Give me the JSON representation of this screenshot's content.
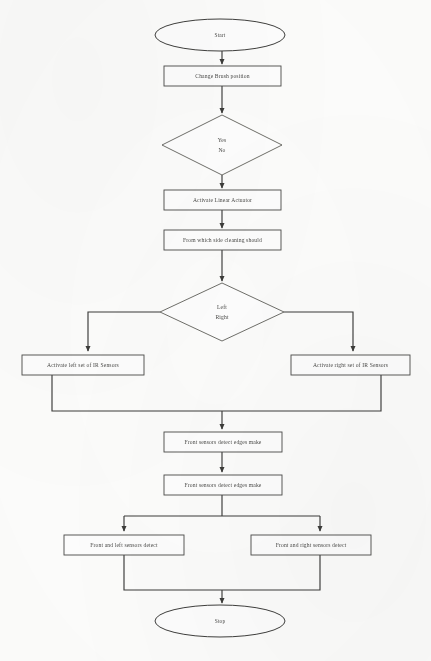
{
  "diagram": {
    "type": "flowchart",
    "orientation": "top-to-bottom",
    "canvas": {
      "width": 431,
      "height": 661
    },
    "style": {
      "background": "#fdfdfc",
      "node_fill": "#fefefe",
      "node_stroke": "#4a4a48",
      "connector_stroke": "#3c3c3a",
      "text_color": "#4b4b49"
    },
    "nodes": [
      {
        "id": "start",
        "shape": "ellipse",
        "label": "Start",
        "cx": 220,
        "cy": 35,
        "rx": 65,
        "ry": 16
      },
      {
        "id": "change-brush",
        "shape": "process",
        "label": "Change Brush position",
        "x": 164,
        "y": 66,
        "w": 117,
        "h": 20
      },
      {
        "id": "decision-yes-no",
        "shape": "decision",
        "label_primary": "Yes",
        "label_secondary": "No",
        "cx": 222,
        "cy": 145,
        "rx": 60,
        "ry": 30
      },
      {
        "id": "activate-linear-actuator",
        "shape": "process",
        "label": "Activate Linear Actuator",
        "x": 164,
        "y": 190,
        "w": 117,
        "h": 20
      },
      {
        "id": "which-side",
        "shape": "process",
        "label": "From which side cleaning should",
        "x": 164,
        "y": 230,
        "w": 117,
        "h": 20
      },
      {
        "id": "decision-left-right",
        "shape": "decision",
        "label_primary": "Left",
        "label_secondary": "Right",
        "cx": 222,
        "cy": 312,
        "rx": 62,
        "ry": 29
      },
      {
        "id": "activate-left-ir",
        "shape": "process",
        "label": "Activate left set of IR Sensors",
        "x": 22,
        "y": 355,
        "w": 122,
        "h": 20
      },
      {
        "id": "activate-right-ir",
        "shape": "process",
        "label": "Activate right set of IR Sensors",
        "x": 291,
        "y": 355,
        "w": 119,
        "h": 20
      },
      {
        "id": "front-sensors-1",
        "shape": "process",
        "label": "Front sensors detect edges   make",
        "x": 164,
        "y": 432,
        "w": 118,
        "h": 20
      },
      {
        "id": "front-sensors-2",
        "shape": "process",
        "label": "Front sensors detect edges   make",
        "x": 164,
        "y": 475,
        "w": 118,
        "h": 20
      },
      {
        "id": "front-left-detect",
        "shape": "process",
        "label": "Front and left sensors detect",
        "x": 64,
        "y": 535,
        "w": 120,
        "h": 20
      },
      {
        "id": "front-right-detect",
        "shape": "process",
        "label": "Front and right sensors detect",
        "x": 251,
        "y": 535,
        "w": 120,
        "h": 20
      },
      {
        "id": "stop",
        "shape": "ellipse",
        "label": "Stop",
        "cx": 220,
        "cy": 621,
        "rx": 65,
        "ry": 16
      }
    ],
    "edges": [
      {
        "id": "e-start-brush",
        "from": "start",
        "to": "change-brush",
        "label": ""
      },
      {
        "id": "e-brush-decision",
        "from": "change-brush",
        "to": "decision-yes-no",
        "label": ""
      },
      {
        "id": "e-decision-actuator",
        "from": "decision-yes-no",
        "to": "activate-linear-actuator",
        "label": ""
      },
      {
        "id": "e-actuator-side",
        "from": "activate-linear-actuator",
        "to": "which-side",
        "label": ""
      },
      {
        "id": "e-side-decision",
        "from": "which-side",
        "to": "decision-left-right",
        "label": ""
      },
      {
        "id": "e-left-branch",
        "from": "decision-left-right",
        "to": "activate-left-ir",
        "label": "Left"
      },
      {
        "id": "e-right-branch",
        "from": "decision-left-right",
        "to": "activate-right-ir",
        "label": "Right"
      },
      {
        "id": "e-left-merge",
        "from": "activate-left-ir",
        "to": "front-sensors-1",
        "label": ""
      },
      {
        "id": "e-right-merge",
        "from": "activate-right-ir",
        "to": "front-sensors-1",
        "label": ""
      },
      {
        "id": "e-front1-front2",
        "from": "front-sensors-1",
        "to": "front-sensors-2",
        "label": ""
      },
      {
        "id": "e-front2-left",
        "from": "front-sensors-2",
        "to": "front-left-detect",
        "label": ""
      },
      {
        "id": "e-front2-right",
        "from": "front-sensors-2",
        "to": "front-right-detect",
        "label": ""
      },
      {
        "id": "e-left-stop",
        "from": "front-left-detect",
        "to": "stop",
        "label": ""
      },
      {
        "id": "e-right-stop",
        "from": "front-right-detect",
        "to": "stop",
        "label": ""
      }
    ]
  }
}
